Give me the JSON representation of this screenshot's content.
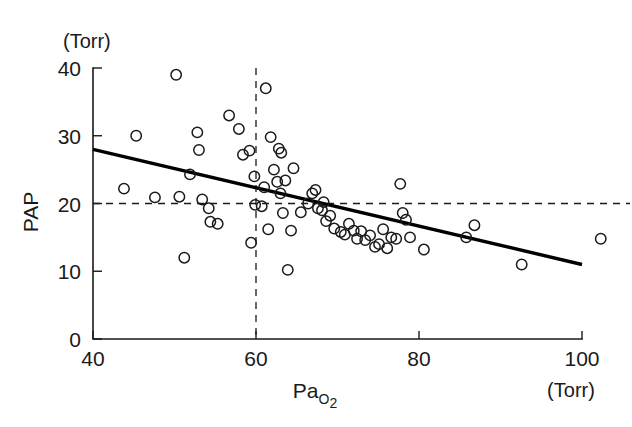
{
  "chart_data": {
    "type": "scatter",
    "title": "",
    "xlabel": "PaO2",
    "xlabel_main": "Pa",
    "xlabel_sub": "O",
    "xlabel_sub2": "2",
    "ylabel": "PAP",
    "x_unit": "(Torr)",
    "y_unit": "(Torr)",
    "xlim": [
      40,
      100
    ],
    "ylim": [
      0,
      40
    ],
    "x_ticks": [
      40,
      60,
      80,
      100
    ],
    "x_tick_labels": [
      "40",
      "60",
      "80",
      "100"
    ],
    "y_ticks": [
      0,
      10,
      20,
      30,
      40
    ],
    "y_tick_labels": [
      "0",
      "10",
      "20",
      "30",
      "40"
    ],
    "grid": false,
    "legend": "none",
    "marker": "open-circle",
    "marker_color": "#1a1a1a",
    "line_color": "#000000",
    "reference_lines": [
      {
        "name": "vertical-threshold",
        "axis": "x",
        "value": 60,
        "style": "dashed"
      },
      {
        "name": "horizontal-threshold",
        "axis": "y",
        "value": 20,
        "style": "dashed"
      }
    ],
    "regression_line": {
      "name": "least-squares-fit",
      "x_start": 40,
      "y_start": 28.0,
      "x_end": 100,
      "y_end": 11.0,
      "slope": -0.283,
      "intercept": 39.3
    },
    "points": [
      {
        "x": 43.8,
        "y": 22.2
      },
      {
        "x": 45.3,
        "y": 30.0
      },
      {
        "x": 47.6,
        "y": 20.9
      },
      {
        "x": 50.2,
        "y": 39.0
      },
      {
        "x": 50.6,
        "y": 21.0
      },
      {
        "x": 51.2,
        "y": 12.0
      },
      {
        "x": 51.9,
        "y": 24.3
      },
      {
        "x": 52.8,
        "y": 30.5
      },
      {
        "x": 53.0,
        "y": 27.9
      },
      {
        "x": 53.4,
        "y": 20.6
      },
      {
        "x": 54.2,
        "y": 19.3
      },
      {
        "x": 54.4,
        "y": 17.3
      },
      {
        "x": 55.3,
        "y": 17.0
      },
      {
        "x": 56.7,
        "y": 33.0
      },
      {
        "x": 57.9,
        "y": 31.0
      },
      {
        "x": 58.4,
        "y": 27.2
      },
      {
        "x": 59.2,
        "y": 27.8
      },
      {
        "x": 59.4,
        "y": 14.2
      },
      {
        "x": 59.8,
        "y": 24.0
      },
      {
        "x": 59.9,
        "y": 19.8
      },
      {
        "x": 60.7,
        "y": 19.6
      },
      {
        "x": 61.0,
        "y": 22.4
      },
      {
        "x": 61.2,
        "y": 37.0
      },
      {
        "x": 61.5,
        "y": 16.2
      },
      {
        "x": 61.8,
        "y": 29.8
      },
      {
        "x": 62.2,
        "y": 25.0
      },
      {
        "x": 62.6,
        "y": 23.2
      },
      {
        "x": 62.8,
        "y": 28.1
      },
      {
        "x": 63.0,
        "y": 21.5
      },
      {
        "x": 63.1,
        "y": 27.5
      },
      {
        "x": 63.3,
        "y": 18.6
      },
      {
        "x": 63.6,
        "y": 23.4
      },
      {
        "x": 63.9,
        "y": 10.2
      },
      {
        "x": 64.3,
        "y": 16.0
      },
      {
        "x": 64.6,
        "y": 25.2
      },
      {
        "x": 65.5,
        "y": 18.7
      },
      {
        "x": 66.4,
        "y": 20.0
      },
      {
        "x": 66.9,
        "y": 21.5
      },
      {
        "x": 67.3,
        "y": 22.0
      },
      {
        "x": 67.6,
        "y": 19.3
      },
      {
        "x": 68.1,
        "y": 19.0
      },
      {
        "x": 68.3,
        "y": 20.2
      },
      {
        "x": 68.6,
        "y": 17.4
      },
      {
        "x": 69.1,
        "y": 18.2
      },
      {
        "x": 69.6,
        "y": 16.3
      },
      {
        "x": 70.4,
        "y": 15.8
      },
      {
        "x": 70.9,
        "y": 15.4
      },
      {
        "x": 71.4,
        "y": 17.0
      },
      {
        "x": 72.0,
        "y": 16.0
      },
      {
        "x": 72.4,
        "y": 14.8
      },
      {
        "x": 72.9,
        "y": 15.9
      },
      {
        "x": 73.4,
        "y": 14.6
      },
      {
        "x": 74.0,
        "y": 15.3
      },
      {
        "x": 74.6,
        "y": 13.6
      },
      {
        "x": 75.1,
        "y": 14.0
      },
      {
        "x": 75.6,
        "y": 16.2
      },
      {
        "x": 76.1,
        "y": 13.4
      },
      {
        "x": 76.6,
        "y": 15.0
      },
      {
        "x": 77.2,
        "y": 14.8
      },
      {
        "x": 77.7,
        "y": 22.9
      },
      {
        "x": 78.0,
        "y": 18.6
      },
      {
        "x": 78.4,
        "y": 17.6
      },
      {
        "x": 78.9,
        "y": 15.0
      },
      {
        "x": 80.6,
        "y": 13.2
      },
      {
        "x": 85.8,
        "y": 15.0
      },
      {
        "x": 86.8,
        "y": 16.8
      },
      {
        "x": 92.6,
        "y": 11.0
      },
      {
        "x": 102.3,
        "y": 14.8
      }
    ]
  }
}
